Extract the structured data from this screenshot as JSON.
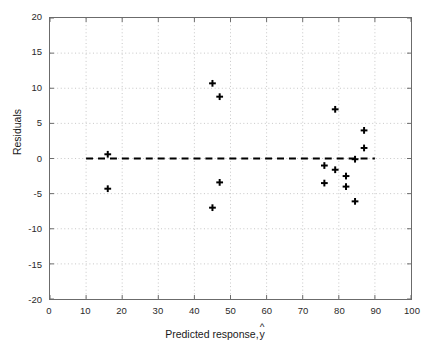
{
  "chart_data": {
    "type": "scatter",
    "title": "",
    "xlabel": "Predicted response, ŷ",
    "xlabel_text": "Predicted response,",
    "xlabel_hat_base": "y",
    "ylabel": "Residuals",
    "xlim": [
      0,
      100
    ],
    "ylim": [
      -20,
      20
    ],
    "xticks": [
      0,
      10,
      20,
      30,
      40,
      50,
      60,
      70,
      80,
      90,
      100
    ],
    "xtick_labels": [
      "0",
      "10",
      "20",
      "30",
      "40",
      "50",
      "60",
      "70",
      "80",
      "90",
      "100"
    ],
    "yticks": [
      -20,
      -15,
      -10,
      -5,
      0,
      5,
      10,
      15,
      20
    ],
    "ytick_labels": [
      "-20",
      "-15",
      "-10",
      "-5",
      "0",
      "5",
      "10",
      "15",
      "20"
    ],
    "grid": true,
    "grid_style": "dotted",
    "legend": null,
    "marker": "plus-bold",
    "marker_color": "#000000",
    "reference_line": {
      "name": "zero-residual-line",
      "y": 0,
      "x_start": 10,
      "x_end": 90,
      "style": "dashed",
      "color": "#000000"
    },
    "x": [
      16.0,
      16.0,
      45.0,
      47.0,
      47.0,
      45.0,
      79.0,
      87.0,
      87.0,
      84.5,
      76.0,
      79.0,
      82.0,
      76.0,
      82.0,
      84.5
    ],
    "y": [
      0.6,
      -4.3,
      10.7,
      8.8,
      -3.4,
      -7.0,
      7.0,
      4.0,
      1.5,
      -0.1,
      -1.0,
      -1.6,
      -2.5,
      -3.5,
      -4.0,
      -6.1
    ],
    "points": [
      {
        "x": 16.0,
        "y": 0.6
      },
      {
        "x": 16.0,
        "y": -4.3
      },
      {
        "x": 45.0,
        "y": 10.7
      },
      {
        "x": 47.0,
        "y": 8.8
      },
      {
        "x": 47.0,
        "y": -3.4
      },
      {
        "x": 45.0,
        "y": -7.0
      },
      {
        "x": 79.0,
        "y": 7.0
      },
      {
        "x": 87.0,
        "y": 4.0
      },
      {
        "x": 87.0,
        "y": 1.5
      },
      {
        "x": 84.5,
        "y": -0.1
      },
      {
        "x": 76.0,
        "y": -1.0
      },
      {
        "x": 79.0,
        "y": -1.6
      },
      {
        "x": 82.0,
        "y": -2.5
      },
      {
        "x": 76.0,
        "y": -3.5
      },
      {
        "x": 82.0,
        "y": -4.0
      },
      {
        "x": 84.5,
        "y": -6.1
      }
    ]
  },
  "colors": {
    "axis": "#6b6b6b",
    "grid": "#b8b8b8",
    "marker": "#000000",
    "background": "#ffffff",
    "text": "#1a1a1a"
  }
}
